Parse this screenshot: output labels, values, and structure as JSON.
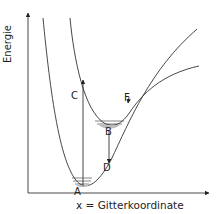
{
  "diagram": {
    "y_axis_label": "Energie",
    "x_axis_label": "x = Gitterkoordinate",
    "points": {
      "A": "A",
      "B": "B",
      "C": "C",
      "D": "D",
      "F": "F"
    },
    "colors": {
      "line": "#333333",
      "fill": "#bdbdbd"
    }
  }
}
